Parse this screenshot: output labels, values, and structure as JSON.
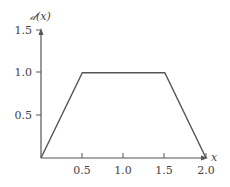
{
  "chart_data": {
    "type": "line",
    "title": "",
    "xlabel": "x",
    "ylabel": "𝒹(x)",
    "x": [
      0,
      0.5,
      1.5,
      2.0
    ],
    "series": [
      {
        "name": "d(x)",
        "values": [
          0,
          1.0,
          1.0,
          0
        ],
        "color": "#555555"
      }
    ],
    "xlim": [
      0,
      2.0
    ],
    "ylim": [
      0,
      1.5
    ],
    "xticks": [
      0.5,
      1.0,
      1.5,
      2.0
    ],
    "yticks": [
      0.5,
      1.0,
      1.5
    ],
    "xtick_labels": [
      "0.5",
      "1.0",
      "1.5",
      "2.0"
    ],
    "ytick_labels": [
      "0.5",
      "1.0",
      "1.5"
    ],
    "grid": false,
    "legend": null
  }
}
